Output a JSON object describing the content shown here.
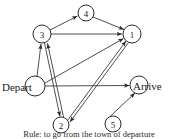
{
  "figure": {
    "caption": "Rule: to go from the town of departure"
  },
  "graph": {
    "background_color": "#ffffff",
    "edge_color": "#3a3a3a",
    "node_fill": "#ffffff",
    "node_stroke": "#2b2b2b",
    "nodes": [
      {
        "id": "4",
        "label": "4",
        "cx": 86,
        "cy": 13,
        "r": 8,
        "kind": "numbered"
      },
      {
        "id": "3",
        "label": "3",
        "cx": 42,
        "cy": 34,
        "r": 9,
        "kind": "numbered"
      },
      {
        "id": "1",
        "label": "1",
        "cx": 132,
        "cy": 34,
        "r": 9,
        "kind": "numbered"
      },
      {
        "id": "depart",
        "label": "Depart",
        "cx": 35,
        "cy": 86,
        "r": 10,
        "kind": "terminal"
      },
      {
        "id": "arrive",
        "label": "Arrive",
        "cx": 139,
        "cy": 85,
        "r": 9,
        "kind": "terminal"
      },
      {
        "id": "2",
        "label": "2",
        "cx": 61,
        "cy": 125,
        "r": 8,
        "kind": "numbered"
      },
      {
        "id": "5",
        "label": "5",
        "cx": 113,
        "cy": 124,
        "r": 8,
        "kind": "numbered"
      }
    ],
    "edges": [
      {
        "from": "3",
        "to": "4",
        "directed": true,
        "arrow_at": "to"
      },
      {
        "from": "4",
        "to": "1",
        "directed": true,
        "arrow_at": "to"
      },
      {
        "from": "3",
        "to": "1",
        "directed": true,
        "arrow_at": "to"
      },
      {
        "from": "depart",
        "to": "3",
        "directed": true,
        "arrow_at": "to"
      },
      {
        "from": "depart",
        "to": "1",
        "directed": true,
        "arrow_at": "to"
      },
      {
        "from": "depart",
        "to": "arrive",
        "directed": true,
        "arrow_at": "to"
      },
      {
        "from": "3",
        "to": "2",
        "directed": true,
        "arrow_at": "to"
      },
      {
        "from": "2",
        "to": "3",
        "directed": true,
        "arrow_at": "to"
      },
      {
        "from": "2",
        "to": "1",
        "directed": true,
        "arrow_at": "to"
      },
      {
        "from": "1",
        "to": "2",
        "directed": true,
        "arrow_at": "to"
      },
      {
        "from": "5",
        "to": "arrive",
        "directed": true,
        "arrow_at": "to"
      }
    ]
  }
}
